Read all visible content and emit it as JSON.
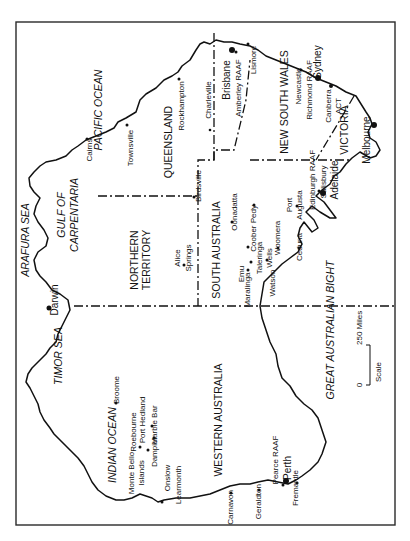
{
  "map": {
    "orientation": "rotated 90 degrees counter-clockwise (north points right)",
    "seas": {
      "pacific": "PACIFIC OCEAN",
      "arafura": "ARAFURA SEA",
      "gulf1": "GULF OF",
      "gulf2": "CARPENTARIA",
      "timor": "TIMOR SEA",
      "indian": "INDIAN OCEAN",
      "bight": "GREAT AUSTRALIAN BIGHT"
    },
    "states": {
      "qld": "QUEENSLAND",
      "nsw": "NEW SOUTH WALES",
      "vic": "VICTORIA",
      "nt1": "NORTHERN",
      "nt2": "TERRITORY",
      "sa": "SOUTH AUSTRALIA",
      "wa": "WESTERN AUSTRALIA"
    },
    "cities": {
      "cairns": "Cairns",
      "townsville": "Townsville",
      "rockhampton": "Rockhampton",
      "charleville": "Charleville",
      "brisbane": "Brisbane",
      "amberley": "Amberley RAAF",
      "lismore": "Lismore",
      "sydney": "Sydney",
      "newcastle": "Newcastle",
      "richmond": "Richmond RAAF",
      "canberra": "Canberra",
      "act": "ACT",
      "melbourne": "Melbourne",
      "birdsville": "Birdsville",
      "alice1": "Alice",
      "alice2": "Springs",
      "darwin": "Darwin",
      "oonadatta": "Oonadatta",
      "cooberpedy": "Coober Pedy",
      "woomera": "Woomera",
      "portaugusta1": "Port",
      "portaugusta2": "Augusta",
      "edinburgh": "Edinburgh RAAF",
      "salisbury": "Salisbury",
      "adelaide": "Adelaide",
      "ceduna": "Ceduna",
      "emu": "Emu",
      "taleringa1": "Taleringa",
      "taleringa2": "Wells",
      "maralinga": "Maralinga",
      "watson": "Watson",
      "broome": "Broome",
      "porthedland": "Port Hedland",
      "marblebar": "Marble Bar",
      "roebourne": "Roebourne",
      "dampier": "Dampier",
      "montebello1": "Monte Bello",
      "montebello2": "Islands",
      "onslow": "Onslow",
      "learmonth": "Learmonth",
      "carnavon": "Carnavon",
      "geraldton": "Geraldton",
      "pearce": "Pearce RAAF",
      "perth": "Perth",
      "fremantle": "Fremantle"
    },
    "scale": {
      "zero": "0",
      "distance": "250 Miles",
      "label": "Scale"
    }
  }
}
